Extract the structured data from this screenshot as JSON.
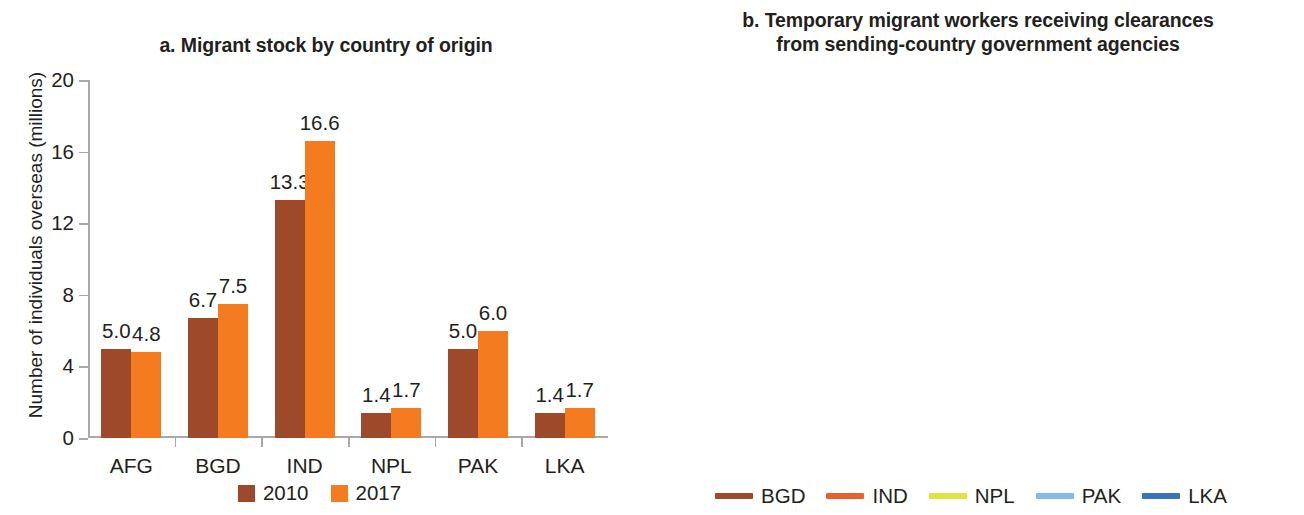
{
  "colors": {
    "bar_2010": "#9e4a2a",
    "bar_2017": "#f47b20",
    "BGD": "#9e4a2a",
    "IND": "#e8602c",
    "NPL": "#dbe442",
    "PAK": "#82bbe8",
    "LKA": "#3773b8",
    "axis": "#a7a9ac",
    "text": "#231f20"
  },
  "panel_a": {
    "title": "a. Migrant stock by country of origin",
    "ylabel": "Number of individuals overseas (millions)",
    "legend": [
      {
        "label": "2010",
        "color": "#9e4a2a"
      },
      {
        "label": "2017",
        "color": "#f47b20"
      }
    ],
    "chart_data": {
      "type": "bar",
      "title": "a. Migrant stock by country of origin",
      "xlabel": "",
      "ylabel": "Number of individuals overseas (millions)",
      "categories": [
        "AFG",
        "BGD",
        "IND",
        "NPL",
        "PAK",
        "LKA"
      ],
      "series": [
        {
          "name": "2010",
          "color": "#9e4a2a",
          "values": [
            5.0,
            6.7,
            13.3,
            1.4,
            5.0,
            1.4
          ]
        },
        {
          "name": "2017",
          "color": "#f47b20",
          "values": [
            4.8,
            7.5,
            16.6,
            1.7,
            6.0,
            1.7
          ]
        }
      ],
      "data_labels": [
        [
          "5.0",
          "6.7",
          "13.3",
          "1.4",
          "5.0",
          "1.4"
        ],
        [
          "4.8",
          "7.5",
          "16.6",
          "1.7",
          "6.0",
          "1.7"
        ]
      ],
      "yticks": [
        0,
        4,
        8,
        12,
        16,
        20
      ],
      "ytick_labels": [
        "0",
        "4",
        "8",
        "12",
        "16",
        "20"
      ],
      "ylim": [
        0,
        20
      ],
      "grid": false,
      "legend_position": "bottom"
    }
  },
  "panel_b": {
    "title_line1": "b. Temporary migrant workers receiving clearances",
    "title_line2": "from sending-country government agencies",
    "ylabel": "Number of migrant workers receiving clearances (hundred thousands)",
    "legend": [
      {
        "label": "BGD",
        "color": "#9e4a2a"
      },
      {
        "label": "IND",
        "color": "#e8602c"
      },
      {
        "label": "NPL",
        "color": "#dbe442"
      },
      {
        "label": "PAK",
        "color": "#82bbe8"
      },
      {
        "label": "LKA",
        "color": "#3773b8"
      }
    ],
    "chart_data": {
      "type": "line",
      "title": "b. Temporary migrant workers receiving clearances from sending-country government agencies",
      "xlabel": "",
      "ylabel": "Number of migrant workers receiving clearances (hundred thousands)",
      "x": [
        2009,
        2010,
        2011,
        2012,
        2013,
        2014,
        2015,
        2016,
        2017
      ],
      "xtick_labels": [
        "2009",
        "2010",
        "2011",
        "2012",
        "2013",
        "2014",
        "2015",
        "2016",
        "2017"
      ],
      "yticks": [
        0,
        2,
        4,
        6,
        8,
        10,
        12
      ],
      "ytick_labels": [
        "0",
        "2",
        "4",
        "6",
        "8",
        "10",
        "12"
      ],
      "ylim": [
        0,
        12
      ],
      "grid": false,
      "legend_position": "bottom",
      "series": [
        {
          "name": "BGD",
          "color": "#9e4a2a",
          "values": [
            4.9,
            3.8,
            5.55,
            5.9,
            3.8,
            3.75,
            6.4,
            7.5,
            9.85
          ]
        },
        {
          "name": "IND",
          "color": "#e8602c",
          "values": [
            6.05,
            6.35,
            6.3,
            7.45,
            8.2,
            8.0,
            7.85,
            5.25,
            3.95
          ]
        },
        {
          "name": "NPL",
          "color": "#dbe442",
          "values": [
            1.6,
            2.2,
            2.45,
            2.55,
            4.35,
            5.05,
            4.9,
            3.85,
            3.65
          ]
        },
        {
          "name": "PAK",
          "color": "#82bbe8",
          "values": [
            4.0,
            3.6,
            4.55,
            6.35,
            6.2,
            7.6,
            9.4,
            8.3,
            5.0
          ]
        },
        {
          "name": "LKA",
          "color": "#3773b8",
          "values": [
            2.45,
            2.65,
            2.6,
            2.85,
            2.9,
            3.0,
            2.75,
            2.4,
            null
          ]
        }
      ]
    }
  }
}
